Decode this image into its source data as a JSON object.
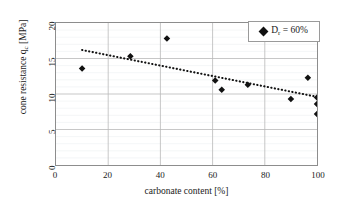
{
  "chart_data": {
    "type": "scatter",
    "title": "",
    "xlabel": "carbonate content [%]",
    "ylabel": "cone resistance q",
    "ylabel_sub": "c",
    "ylabel_unit": " [MPa]",
    "xlim": [
      0,
      100
    ],
    "ylim": [
      0,
      20
    ],
    "xticks": [
      0,
      20,
      40,
      60,
      80,
      100
    ],
    "yticks": [
      0,
      5,
      10,
      15,
      20
    ],
    "grid": true,
    "legend_position": "top-right",
    "series": [
      {
        "name": "D_r = 60%",
        "marker": "diamond",
        "color": "#111111",
        "points": [
          {
            "x": 10,
            "y": 13.6
          },
          {
            "x": 28.5,
            "y": 15.3
          },
          {
            "x": 42.5,
            "y": 17.8
          },
          {
            "x": 61,
            "y": 11.9
          },
          {
            "x": 63.5,
            "y": 10.6
          },
          {
            "x": 73.5,
            "y": 11.3
          },
          {
            "x": 90,
            "y": 9.3
          },
          {
            "x": 96.5,
            "y": 12.3
          },
          {
            "x": 100,
            "y": 9.5
          },
          {
            "x": 100,
            "y": 8.6
          },
          {
            "x": 100,
            "y": 7.2
          }
        ]
      }
    ],
    "trendline": {
      "style": "dotted",
      "color": "#111111",
      "x0": 10,
      "y0": 16.2,
      "x1": 100,
      "y1": 9.6
    }
  },
  "legend": {
    "label_prefix": "D",
    "label_sub": "r",
    "label_suffix": " = 60%",
    "full_label": "D r = 60%"
  },
  "axes": {
    "x_title": "carbonate content [%]",
    "y_title_main": "cone resistance q",
    "y_title_sub": "c",
    "y_title_unit": " [MPa]"
  }
}
